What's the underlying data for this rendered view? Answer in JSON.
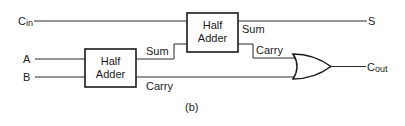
{
  "diagram": {
    "type": "full-adder-from-half-adders",
    "caption": "(b)",
    "inputs": {
      "cin": {
        "base": "C",
        "sub": "in"
      },
      "a": "A",
      "b": "B"
    },
    "outputs": {
      "s": "S",
      "cout": {
        "base": "C",
        "sub": "out"
      }
    },
    "half_adder_1": {
      "line1": "Half",
      "line2": "Adder",
      "sum_label": "Sum",
      "carry_label": "Carry"
    },
    "half_adder_2": {
      "line1": "Half",
      "line2": "Adder",
      "sum_label": "Sum",
      "carry_label": "Carry"
    },
    "or_gate": {
      "name": "OR"
    },
    "colors": {
      "line": "#2a2a2a",
      "text": "#1a1a1a",
      "background": "#ffffff"
    }
  }
}
